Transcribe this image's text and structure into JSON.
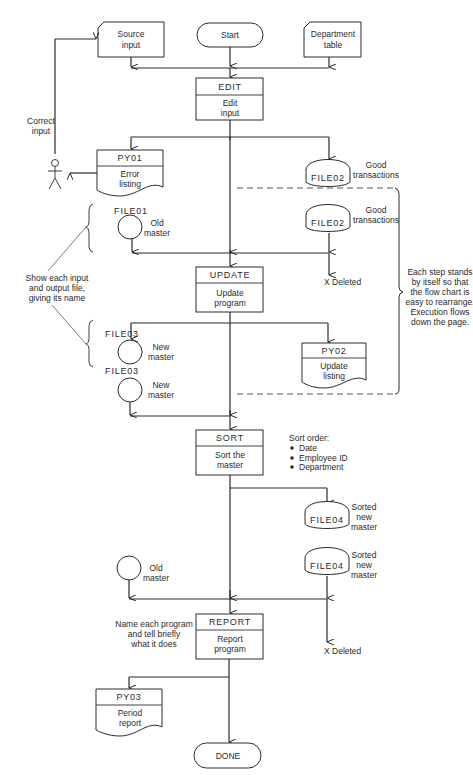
{
  "terminals": {
    "start": "Start",
    "done": "DONE"
  },
  "inputs": {
    "source": [
      "Source",
      "input"
    ],
    "department": [
      "Department",
      "table"
    ]
  },
  "actor": {
    "label": [
      "Correct",
      "input"
    ]
  },
  "programs": {
    "edit": {
      "name": "EDIT",
      "desc": [
        "Edit",
        "input"
      ]
    },
    "update": {
      "name": "UPDATE",
      "desc": [
        "Update",
        "program"
      ]
    },
    "sort": {
      "name": "SORT",
      "desc": [
        "Sort the",
        "master"
      ]
    },
    "report": {
      "name": "REPORT",
      "desc": [
        "Report",
        "program"
      ]
    }
  },
  "documents": {
    "py01": {
      "name": "PY01",
      "desc": [
        "Error",
        "listing"
      ]
    },
    "py02": {
      "name": "PY02",
      "desc": [
        "Update",
        "listing"
      ]
    },
    "py03": {
      "name": "PY03",
      "desc": [
        "Period",
        "report"
      ]
    }
  },
  "disks": {
    "file02_out": {
      "name": "FILE02",
      "desc": [
        "Good",
        "transactions"
      ]
    },
    "file02_in": {
      "name": "FILE02",
      "desc": [
        "Good",
        "transactions"
      ]
    },
    "file04_out": {
      "name": "FILE04",
      "desc": [
        "Sorted",
        "new",
        "master"
      ]
    },
    "file04_in": {
      "name": "FILE04",
      "desc": [
        "Sorted",
        "new",
        "master"
      ]
    }
  },
  "tapes": {
    "file01": {
      "name": "FILE01",
      "desc": [
        "Old",
        "master"
      ]
    },
    "file03_out": {
      "name": "FILE03",
      "desc": [
        "New",
        "master"
      ]
    },
    "file03_in": {
      "name": "FILE03",
      "desc": [
        "New",
        "master"
      ]
    },
    "old_master_report": {
      "name": "",
      "desc": [
        "Old",
        "master"
      ]
    }
  },
  "deleted": {
    "after_update": "X Deleted",
    "after_report": "X Deleted"
  },
  "sort_order": {
    "title": "Sort order:",
    "items": [
      "Date",
      "Employee ID",
      "Department"
    ]
  },
  "annotations": {
    "show_files": [
      "Show each input",
      "and output file,",
      "giving its name"
    ],
    "each_step": [
      "Each step stands",
      "by itself so that",
      "the flow chart is",
      "easy to rearrange.",
      "Execution flows",
      "down the page."
    ],
    "name_program": [
      "Name each program",
      "and tell briefly",
      "what it does"
    ]
  },
  "colors": {
    "line": "#2a2a2a",
    "background": "#ffffff"
  }
}
